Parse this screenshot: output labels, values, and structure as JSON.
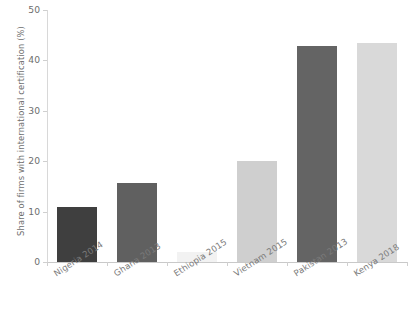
{
  "chart_data": {
    "type": "bar",
    "title": "",
    "xlabel": "",
    "ylabel": "Share of firms with international certification (%)",
    "categories": [
      "Nigeria 2014",
      "Ghana 2013",
      "Ethiopia 2015",
      "Vietnam 2015",
      "Pakistan 2013",
      "Kenya 2018"
    ],
    "values": [
      11.0,
      15.7,
      2.0,
      20.0,
      42.8,
      43.4
    ],
    "ylim": [
      0,
      50
    ],
    "yticks": [
      0,
      10,
      20,
      30,
      40,
      50
    ],
    "ytick_labels": [
      "0",
      "10",
      "20",
      "30",
      "40",
      "50"
    ],
    "grid": false,
    "legend": "none",
    "bar_colors": [
      "#3f3f3f",
      "#606060",
      "#f2f2f2",
      "#cfcfcf",
      "#646464",
      "#d9d9d9"
    ]
  },
  "axis": {
    "y_title": "Share of firms with international certification (%)"
  }
}
